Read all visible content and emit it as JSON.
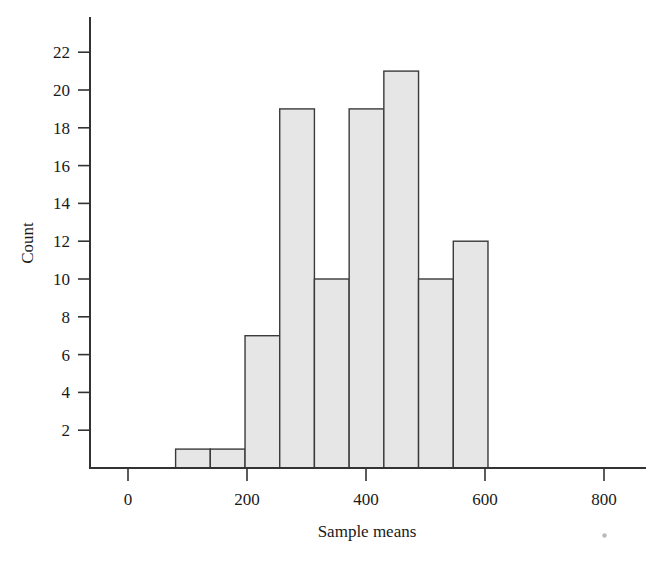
{
  "chart_data": {
    "type": "bar",
    "title": "",
    "subtitle": "",
    "xlabel": "Sample means",
    "ylabel": "Count",
    "grid": false,
    "legend": false,
    "legend_position": "none",
    "bin_width": 58.3,
    "bin_starts": [
      80,
      138.3,
      196.7,
      255,
      313.3,
      371.7,
      430,
      488.3,
      546.7
    ],
    "bin_ends": [
      138.3,
      196.7,
      255,
      313.3,
      371.7,
      430,
      488.3,
      546.7,
      605
    ],
    "categories": [
      "80-138",
      "138-197",
      "197-255",
      "255-313",
      "313-372",
      "372-430",
      "430-488",
      "488-547",
      "547-605"
    ],
    "values": [
      1,
      1,
      7,
      19,
      10,
      19,
      21,
      10,
      12
    ],
    "xlim": [
      -20,
      880
    ],
    "ylim": [
      0,
      23.5
    ],
    "x_ticks": [
      0,
      200,
      400,
      600,
      800
    ],
    "x_tick_labels": [
      "0",
      "200",
      "400",
      "600",
      "800"
    ],
    "y_ticks": [
      2,
      4,
      6,
      8,
      10,
      12,
      14,
      16,
      18,
      20,
      22
    ],
    "y_tick_labels": [
      "2",
      "4",
      "6",
      "8",
      "10",
      "12",
      "14",
      "16",
      "18",
      "20",
      "22"
    ],
    "bar_fill_color": "#e6e6e6",
    "bar_edge_color": "#3a3a3a",
    "axis_color": "#333333",
    "background_color": "#ffffff",
    "total_count": 101
  },
  "axes": {
    "y_title": "Count",
    "x_title": "Sample means"
  },
  "artifact": {
    "speck_label": "scan-speck"
  }
}
